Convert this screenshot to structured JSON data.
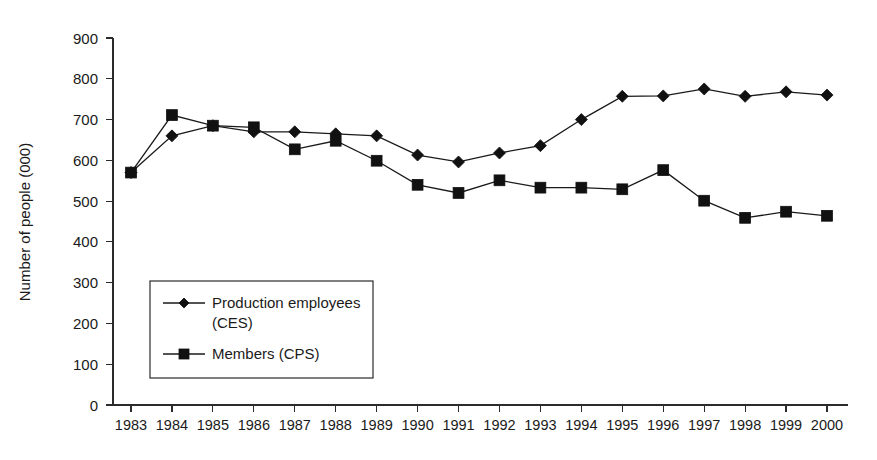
{
  "chart_data": {
    "type": "line",
    "title": "",
    "subtitle": "",
    "xlabel": "",
    "ylabel": "Number of people (000)",
    "categories": [
      "1983",
      "1984",
      "1985",
      "1986",
      "1987",
      "1988",
      "1989",
      "1990",
      "1991",
      "1992",
      "1993",
      "1994",
      "1995",
      "1996",
      "1997",
      "1998",
      "1999",
      "2000"
    ],
    "series": [
      {
        "name": "Production employees (CES)",
        "marker": "diamond",
        "values": [
          570,
          660,
          685,
          670,
          670,
          665,
          660,
          613,
          596,
          618,
          636,
          700,
          757,
          758,
          775,
          757,
          768,
          760
        ]
      },
      {
        "name": "Members (CPS)",
        "marker": "square",
        "values": [
          570,
          711,
          685,
          681,
          627,
          648,
          599,
          540,
          520,
          551,
          533,
          533,
          529,
          576,
          501,
          459,
          474,
          464
        ]
      }
    ],
    "ylim": [
      0,
      900
    ],
    "yticks": [
      0,
      100,
      200,
      300,
      400,
      500,
      600,
      700,
      800,
      900
    ],
    "grid": false,
    "legend_position": "inside-lower-left",
    "legend_entries": [
      {
        "label_line1": "Production employees",
        "label_line2": "(CES)",
        "marker": "diamond"
      },
      {
        "label_line1": "Members (CPS)",
        "label_line2": "",
        "marker": "square"
      }
    ]
  },
  "axes": {
    "y_title": "Number of people (000)",
    "y_tick_labels": [
      "900",
      "800",
      "700",
      "600",
      "500",
      "400",
      "300",
      "200",
      "100",
      "0"
    ],
    "x_tick_labels": [
      "1983",
      "1984",
      "1985",
      "1986",
      "1987",
      "1988",
      "1989",
      "1990",
      "1991",
      "1992",
      "1993",
      "1994",
      "1995",
      "1996",
      "1997",
      "1998",
      "1999",
      "2000"
    ]
  },
  "legend": {
    "items": [
      {
        "line1": "Production employees",
        "line2": "(CES)"
      },
      {
        "line1": "Members (CPS)",
        "line2": ""
      }
    ]
  },
  "colors": {
    "line": "#1a1a1a",
    "marker": "#111111",
    "axis": "#2b2b2b",
    "background": "#ffffff"
  }
}
